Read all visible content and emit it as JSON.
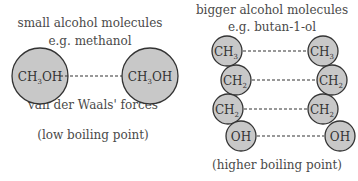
{
  "left": {
    "title": "small alcohol molecules",
    "example": "e.g. methanol",
    "molecules": [
      {
        "main": "CH",
        "sub": "3",
        "tail": "OH"
      },
      {
        "main": "CH",
        "sub": "3",
        "tail": "OH"
      }
    ],
    "force_label": "van der Waals' forces",
    "boiling": "(low boiling point)"
  },
  "right": {
    "title": "bigger alcohol molecules",
    "example": "e.g. butan-1-ol",
    "groups": [
      {
        "main": "CH",
        "sub": "3"
      },
      {
        "main": "CH",
        "sub": "2"
      },
      {
        "main": "CH",
        "sub": "2"
      },
      {
        "main": "OH",
        "sub": ""
      }
    ],
    "boiling": "(higher boiling point)"
  }
}
